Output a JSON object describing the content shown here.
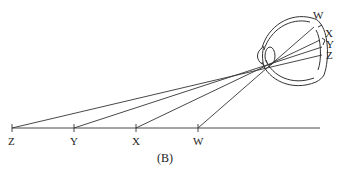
{
  "diagram": {
    "caption": "(B)",
    "object_points": [
      {
        "label": "Z",
        "x": 12
      },
      {
        "label": "Y",
        "x": 74
      },
      {
        "label": "X",
        "x": 136
      },
      {
        "label": "W",
        "x": 198
      }
    ],
    "retina_points": [
      {
        "label": "W"
      },
      {
        "label": "X"
      },
      {
        "label": "Y"
      },
      {
        "label": "Z"
      }
    ],
    "stroke_color": "#333333",
    "background": "#ffffff"
  }
}
